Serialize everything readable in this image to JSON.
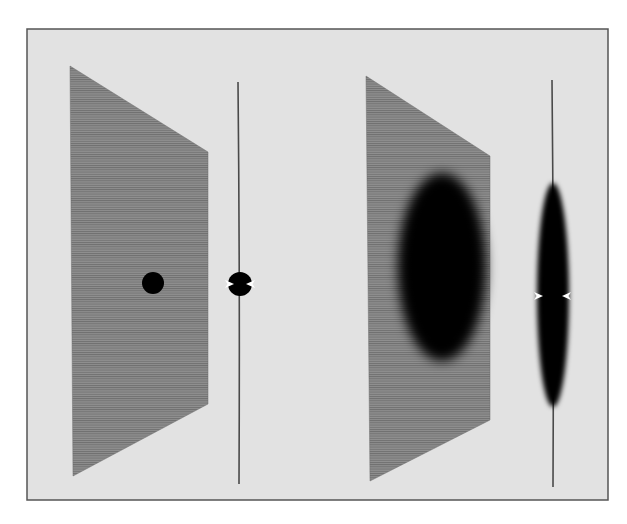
{
  "figure": {
    "background": "#ffffff",
    "frame": {
      "x": 27,
      "y": 29,
      "width": 581,
      "height": 471,
      "fill": "#e2e2e2",
      "stroke": "#555555"
    },
    "colors": {
      "sheet": "#8a8a8a",
      "sheet_line": "#6f6f6f",
      "spot": "#050505",
      "edge_line": "#4a4a4a",
      "arrow": "#ffffff"
    },
    "panels": [
      {
        "name": "small-deformation",
        "sheet": {
          "points": "70,66 208,152 208,404 73,476"
        },
        "spot": {
          "cx": 153,
          "cy": 283,
          "rx": 11,
          "ry": 11,
          "blur": 0.6
        },
        "edge_view": {
          "line": {
            "x": 238,
            "y1": 82,
            "y2": 484,
            "bulge": 2
          },
          "spot": {
            "cx": 240,
            "cy": 284,
            "rx": 12,
            "ry": 12,
            "blur": 0.5
          },
          "arrows": [
            {
              "x": 229,
              "y": 284,
              "dir": "right"
            },
            {
              "x": 251,
              "y": 284,
              "dir": "left"
            }
          ]
        }
      },
      {
        "name": "large-deformation",
        "sheet": {
          "points": "366,76 490,156 490,420 370,481"
        },
        "spot": {
          "cx": 442,
          "cy": 267,
          "rx": 44,
          "ry": 94,
          "blur": 5
        },
        "edge_view": {
          "line": {
            "x": 552,
            "y1": 80,
            "y2": 487,
            "bulge": 2
          },
          "spot": {
            "cx": 553,
            "cy": 295,
            "rx": 16,
            "ry": 112,
            "blur": 2.5
          },
          "arrows": [
            {
              "x": 538,
              "y": 296,
              "dir": "right"
            },
            {
              "x": 567,
              "y": 296,
              "dir": "left"
            }
          ]
        }
      }
    ]
  }
}
